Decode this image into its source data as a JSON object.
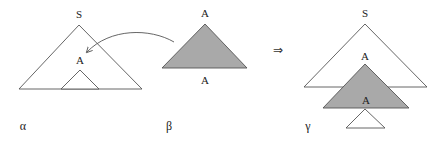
{
  "diagram": {
    "colors": {
      "line": "#555555",
      "shaded_fill": "#a9a9a9",
      "open_fill": "#ffffff",
      "text": "#222222"
    },
    "alpha": {
      "caption": "α",
      "root_label": "S",
      "inner_node_label": "A"
    },
    "beta": {
      "caption": "β",
      "root_label": "A",
      "foot_label": "A"
    },
    "implies_symbol": "⇒",
    "gamma": {
      "caption": "γ",
      "root_label": "S",
      "adjoined_root_label": "A",
      "adjoined_foot_label": "A"
    },
    "arrow": {
      "from": "beta",
      "to": "alpha.inner_node"
    }
  }
}
